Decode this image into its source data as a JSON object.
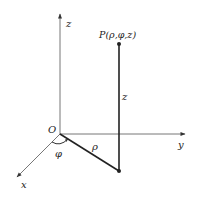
{
  "diagram": {
    "labels": {
      "z_axis": "z",
      "y_axis": "y",
      "x_axis": "x",
      "origin": "O",
      "point": "P(ρ,φ,z)",
      "height": "z",
      "radius": "ρ",
      "angle": "φ"
    },
    "colors": {
      "axis": "#555555",
      "segment": "#222222",
      "text": "#222222"
    }
  }
}
